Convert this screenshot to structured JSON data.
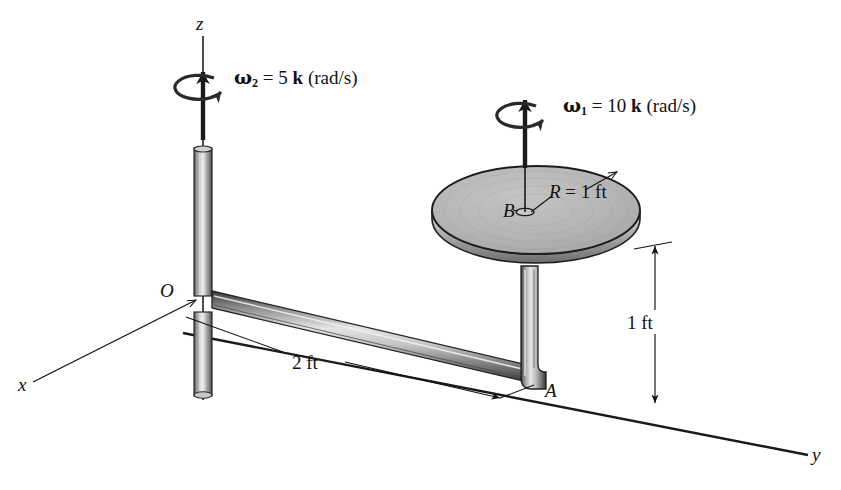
{
  "figure": {
    "background_color": "#ffffff",
    "ink_color": "#111111",
    "metal_light": "#e8e8e8",
    "metal_mid": "#b9b9b9",
    "metal_dark": "#6f6f6f",
    "disk_face": "#b3b3b3",
    "disk_rim": "#8f8f8f"
  },
  "axes": {
    "z": {
      "label": "z",
      "x": 196,
      "y": 22
    },
    "x": {
      "label": "x",
      "x": 18,
      "y": 384
    },
    "y": {
      "label": "y",
      "x": 812,
      "y": 448
    }
  },
  "points": {
    "O": {
      "label": "O",
      "x": 160,
      "y": 281
    },
    "A": {
      "label": "A",
      "x": 545,
      "y": 389
    },
    "B": {
      "label": "B",
      "x": 503,
      "y": 202
    }
  },
  "angular_velocities": [
    {
      "name": "omega-2",
      "symbol": "ω",
      "subscript": "2",
      "equals": "=",
      "magnitude": "5",
      "unit_vector": "k",
      "units": "(rad/s)",
      "full_text": "ω2 = 5 k (rad/s)",
      "x": 234,
      "y": 77,
      "axis": "z-axis at O"
    },
    {
      "name": "omega-1",
      "symbol": "ω",
      "subscript": "1",
      "equals": "=",
      "magnitude": "10",
      "unit_vector": "k",
      "units": "(rad/s)",
      "full_text": "ω1 = 10 k (rad/s)",
      "x": 563,
      "y": 105,
      "axis": "vertical axis at B"
    }
  ],
  "dimensions": [
    {
      "name": "disk-radius",
      "text": "R = 1 ft",
      "italic_part": "R",
      "rest": " = 1 ft",
      "x": 528,
      "y": 190,
      "refers_to": "disk radius at B"
    },
    {
      "name": "arm-length",
      "text": "2 ft",
      "x": 303,
      "y": 362,
      "refers_to": "horizontal distance O to A along y"
    },
    {
      "name": "post-height",
      "text": "1 ft",
      "x": 627,
      "y": 322,
      "refers_to": "vertical distance from y-axis up to disk at A"
    }
  ]
}
